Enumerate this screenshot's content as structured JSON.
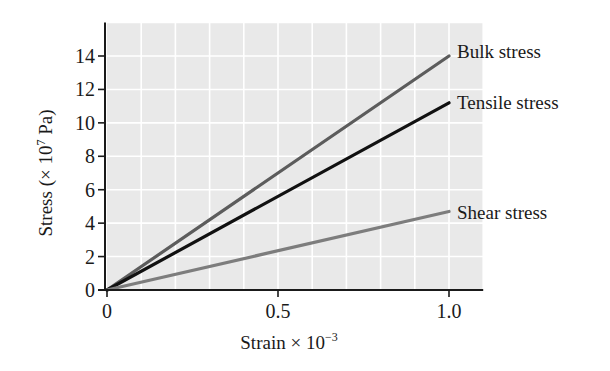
{
  "chart_data": {
    "type": "line",
    "title": "",
    "xlabel": "Strain × 10⁻³",
    "xlabel_parts": {
      "base": "Strain × 10",
      "sup": "−3"
    },
    "ylabel": "Stress (× 10⁷ Pa)",
    "ylabel_parts": {
      "pre": "Stress (× 10",
      "sup": "7",
      "post": " Pa)"
    },
    "xlim": [
      0,
      1.1
    ],
    "ylim": [
      0,
      16
    ],
    "x_ticks": [
      0,
      0.5,
      1.0
    ],
    "x_tick_labels": [
      "0",
      "0.5",
      "1.0"
    ],
    "y_ticks": [
      0,
      2,
      4,
      6,
      8,
      10,
      12,
      14
    ],
    "y_tick_labels": [
      "0",
      "2",
      "4",
      "6",
      "8",
      "10",
      "12",
      "14"
    ],
    "grid": true,
    "grid_x_step": 0.1,
    "grid_y_step": 2,
    "legend_position": "inline-right-of-line-ends",
    "series": [
      {
        "name": "Bulk stress",
        "x": [
          0,
          1.0
        ],
        "values": [
          0,
          14.0
        ],
        "color": "#5c5c5c"
      },
      {
        "name": "Tensile stress",
        "x": [
          0,
          1.0
        ],
        "values": [
          0,
          11.2
        ],
        "color": "#111111"
      },
      {
        "name": "Shear stress",
        "x": [
          0,
          1.0
        ],
        "values": [
          0,
          4.7
        ],
        "color": "#7d7d7d"
      }
    ]
  },
  "colors": {
    "plot_background": "#e9e9e9",
    "grid": "#ffffff",
    "axis": "#1a1a1a"
  }
}
